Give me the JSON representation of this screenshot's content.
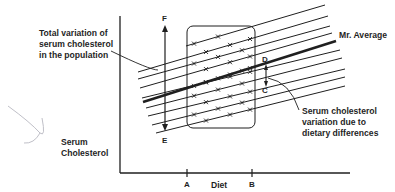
{
  "diagram": {
    "labels": {
      "total_variation": [
        "Total variation of",
        "serum cholesterol",
        "in the population"
      ],
      "mr_average": "Mr. Average",
      "dietary_variation": [
        "Serum cholesterol",
        "variation due to",
        "dietary differences"
      ],
      "y_axis": [
        "Serum",
        "Cholesterol"
      ],
      "x_axis": "Diet"
    },
    "points": {
      "F": "F",
      "E": "E",
      "D": "D",
      "C": "C",
      "A": "A",
      "B": "B"
    },
    "colors": {
      "ink": "#1f1f1f",
      "background": "#ffffff",
      "annotation_mark": "#b8b8c0"
    }
  }
}
